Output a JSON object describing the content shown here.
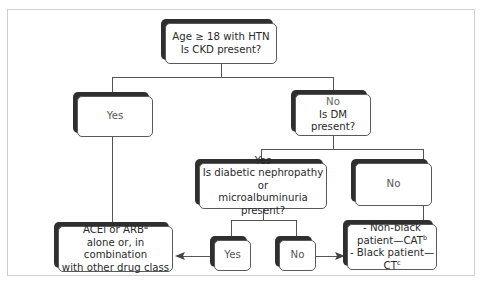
{
  "diagram": {
    "type": "flowchart",
    "nodes": {
      "root": {
        "line1": "Age ≥ 18 with HTN",
        "line2": "Is CKD present?"
      },
      "ckd_yes": {
        "label": "Yes"
      },
      "ckd_no": {
        "line1": "No",
        "line2": "Is DM present?"
      },
      "dm_yes": {
        "line1": "Yes",
        "line2": "Is diabetic nephropathy or",
        "line3": "microalbuminuria present?"
      },
      "dm_no": {
        "label": "No"
      },
      "neph_yes": {
        "label": "Yes"
      },
      "neph_no": {
        "label": "No"
      },
      "acei_arb": {
        "line1": "ACEi or ARB",
        "line1_sup": "a",
        "line2": "alone or, in combination",
        "line3": "with other drug class"
      },
      "race_based": {
        "line1": "- Non-black",
        "line2": "patient—CAT",
        "line2_sup": "b",
        "line3": "- Black patient—CT",
        "line3_sup": "c"
      }
    },
    "edges": [
      {
        "from": "root",
        "to": "ckd_yes"
      },
      {
        "from": "root",
        "to": "ckd_no"
      },
      {
        "from": "ckd_no",
        "to": "dm_yes"
      },
      {
        "from": "ckd_no",
        "to": "dm_no"
      },
      {
        "from": "dm_yes",
        "to": "neph_yes"
      },
      {
        "from": "dm_yes",
        "to": "neph_no"
      },
      {
        "from": "ckd_yes",
        "to": "acei_arb"
      },
      {
        "from": "neph_yes",
        "to": "acei_arb",
        "arrow": true
      },
      {
        "from": "neph_no",
        "to": "race_based",
        "arrow": true
      },
      {
        "from": "dm_no",
        "to": "race_based"
      }
    ]
  }
}
